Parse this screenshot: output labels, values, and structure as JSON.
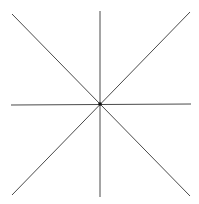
{
  "diagram": {
    "type": "radial-lines",
    "background": "#ffffff",
    "stroke_color": "#4a4a4a",
    "center_color": "#111111",
    "center": {
      "x": 100,
      "y": 104
    },
    "lines": [
      {
        "name": "vertical-line",
        "x1": 100,
        "y1": 11,
        "x2": 100,
        "y2": 197
      },
      {
        "name": "horizontal-line",
        "x1": 11,
        "y1": 105,
        "x2": 191,
        "y2": 104
      },
      {
        "name": "diagonal-line-descending",
        "x1": 12,
        "y1": 14,
        "x2": 190,
        "y2": 196
      },
      {
        "name": "diagonal-line-ascending",
        "x1": 12,
        "y1": 195,
        "x2": 190,
        "y2": 12
      }
    ]
  }
}
